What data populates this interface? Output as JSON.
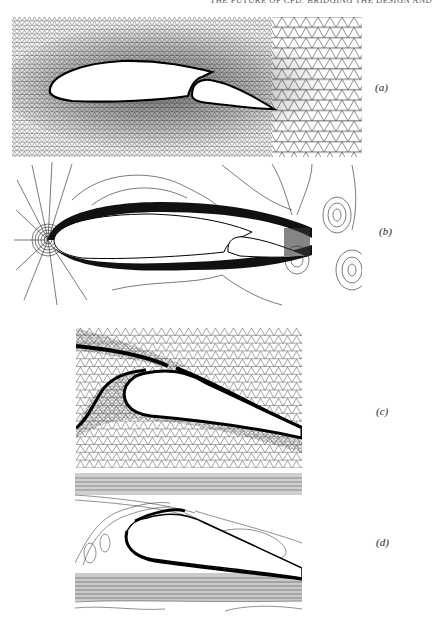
{
  "header": {
    "running_title": "THE FUTURE OF CFD: BRIDGING THE DESIGN AND"
  },
  "figure": {
    "panels": [
      {
        "id": "a",
        "label": "(a)",
        "content": "unstructured triangular mesh around two-element airfoil (main + flap)"
      },
      {
        "id": "b",
        "label": "(b)",
        "content": "flow contour lines around two-element airfoil"
      },
      {
        "id": "c",
        "label": "(c)",
        "content": "close-up mesh of flap leading edge region"
      },
      {
        "id": "d",
        "label": "(d)",
        "content": "close-up contour lines of flap leading edge region"
      }
    ]
  },
  "colors": {
    "ink": "#111111",
    "paper": "#ffffff",
    "mesh": "#2a2a2a"
  }
}
